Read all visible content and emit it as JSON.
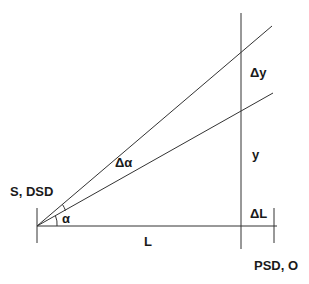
{
  "diagram": {
    "labels": {
      "source": "S, DSD",
      "detector": "PSD, O",
      "alpha": "α",
      "delta_alpha": "Δα",
      "L": "L",
      "delta_L": "ΔL",
      "y": "y",
      "delta_y": "Δy"
    },
    "colors": {
      "line": "#333333",
      "text": "#1a1a1a",
      "background": "#ffffff"
    }
  }
}
